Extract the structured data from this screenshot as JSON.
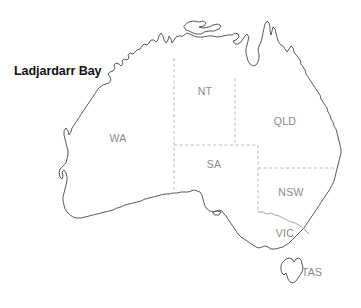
{
  "figure": {
    "kind": "map",
    "background_color": "#ffffff",
    "width": 361,
    "height": 308
  },
  "colors": {
    "coastline": "#4a4a4a",
    "land_fill": "#ffffff",
    "state_border_dashed": "#b2b2b2",
    "state_border_solid": "#8d8d8d",
    "state_label": "#8a8a8a",
    "place_label": "#111111"
  },
  "place_labels": [
    {
      "id": "ladjardarr-bay",
      "text": "Ladjardarr Bay",
      "x": 14,
      "y": 71
    }
  ],
  "state_labels": [
    {
      "id": "wa",
      "text": "WA",
      "x": 118,
      "y": 138
    },
    {
      "id": "nt",
      "text": "NT",
      "x": 205,
      "y": 91
    },
    {
      "id": "qld",
      "text": "QLD",
      "x": 285,
      "y": 121
    },
    {
      "id": "sa",
      "text": "SA",
      "x": 214,
      "y": 164
    },
    {
      "id": "nsw",
      "text": "NSW",
      "x": 291,
      "y": 192
    },
    {
      "id": "vic",
      "text": "VIC",
      "x": 285,
      "y": 233
    },
    {
      "id": "tas",
      "text": "TAS",
      "x": 312,
      "y": 272
    }
  ]
}
